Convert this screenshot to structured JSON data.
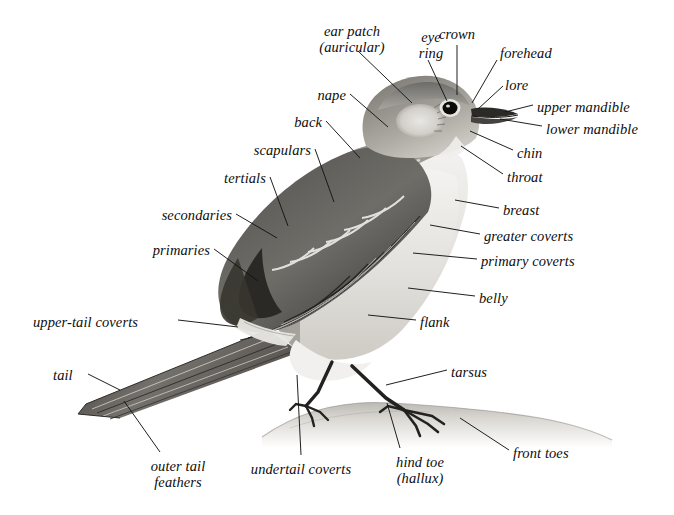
{
  "diagram": {
    "background_color": "#ffffff",
    "ink_color": "#0d0d0d",
    "label_style": "italic serif"
  },
  "labels": [
    {
      "id": "ear-patch",
      "text": "ear patch\n(auricular)",
      "align": "center",
      "x": 303,
      "y": 24,
      "w": 98
    },
    {
      "id": "eye-ring",
      "text": "eye\nring",
      "align": "center",
      "x": 411,
      "y": 30,
      "w": 40
    },
    {
      "id": "crown",
      "text": "crown",
      "align": "center",
      "x": 428,
      "y": 27,
      "w": 58
    },
    {
      "id": "forehead",
      "text": "forehead",
      "align": "left",
      "x": 500,
      "y": 46,
      "w": 72
    },
    {
      "id": "lore",
      "text": "lore",
      "align": "left",
      "x": 505,
      "y": 78,
      "w": 40
    },
    {
      "id": "upper-mandible",
      "text": "upper mandible",
      "align": "left",
      "x": 537,
      "y": 100,
      "w": 128
    },
    {
      "id": "lower-mandible",
      "text": "lower mandible",
      "align": "left",
      "x": 546,
      "y": 122,
      "w": 128
    },
    {
      "id": "chin",
      "text": "chin",
      "align": "left",
      "x": 517,
      "y": 146,
      "w": 42
    },
    {
      "id": "throat",
      "text": "throat",
      "align": "left",
      "x": 507,
      "y": 170,
      "w": 56
    },
    {
      "id": "breast",
      "text": "breast",
      "align": "left",
      "x": 503,
      "y": 203,
      "w": 58
    },
    {
      "id": "greater-coverts",
      "text": "greater coverts",
      "align": "left",
      "x": 484,
      "y": 229,
      "w": 130
    },
    {
      "id": "primary-coverts",
      "text": "primary coverts",
      "align": "left",
      "x": 481,
      "y": 254,
      "w": 130
    },
    {
      "id": "belly",
      "text": "belly",
      "align": "left",
      "x": 479,
      "y": 291,
      "w": 46
    },
    {
      "id": "flank",
      "text": "flank",
      "align": "left",
      "x": 420,
      "y": 315,
      "w": 46
    },
    {
      "id": "tarsus",
      "text": "tarsus",
      "align": "left",
      "x": 451,
      "y": 365,
      "w": 54
    },
    {
      "id": "front-toes",
      "text": "front toes",
      "align": "left",
      "x": 513,
      "y": 446,
      "w": 84
    },
    {
      "id": "hind-toe",
      "text": "hind toe\n(hallux)",
      "align": "center",
      "x": 383,
      "y": 455,
      "w": 74
    },
    {
      "id": "undertail-coverts",
      "text": "undertail coverts",
      "align": "center",
      "x": 231,
      "y": 462,
      "w": 140
    },
    {
      "id": "outer-tail-feathers",
      "text": "outer tail\nfeathers",
      "align": "center",
      "x": 136,
      "y": 459,
      "w": 84
    },
    {
      "id": "tail",
      "text": "tail",
      "align": "left",
      "x": 53,
      "y": 368,
      "w": 32
    },
    {
      "id": "upper-tail-coverts",
      "text": "upper-tail coverts",
      "align": "left",
      "x": 33,
      "y": 315,
      "w": 142
    },
    {
      "id": "primaries",
      "text": "primaries",
      "align": "right",
      "x": 132,
      "y": 243,
      "w": 78
    },
    {
      "id": "secondaries",
      "text": "secondaries",
      "align": "right",
      "x": 136,
      "y": 208,
      "w": 96
    },
    {
      "id": "tertials",
      "text": "tertials",
      "align": "right",
      "x": 200,
      "y": 171,
      "w": 66
    },
    {
      "id": "scapulars",
      "text": "scapulars",
      "align": "right",
      "x": 229,
      "y": 143,
      "w": 82
    },
    {
      "id": "back",
      "text": "back",
      "align": "right",
      "x": 278,
      "y": 115,
      "w": 44
    },
    {
      "id": "nape",
      "text": "nape",
      "align": "right",
      "x": 300,
      "y": 88,
      "w": 46
    }
  ],
  "leader_lines": [
    {
      "id": "ear-patch-leader",
      "d": "M 358 51 L 412 103"
    },
    {
      "id": "eye-ring-leader",
      "d": "M 428 60 L 447 101"
    },
    {
      "id": "crown-leader",
      "d": "M 457 45 L 457 95"
    },
    {
      "id": "forehead-leader",
      "d": "M 497 60 L 472 103"
    },
    {
      "id": "lore-leader",
      "d": "M 503 86 L 478 109"
    },
    {
      "id": "upper-mandible-leader",
      "d": "M 533 105 L 505 112"
    },
    {
      "id": "lower-mandible-leader",
      "d": "M 542 126 L 500 119"
    },
    {
      "id": "chin-leader",
      "d": "M 513 150 L 470 131"
    },
    {
      "id": "throat-leader",
      "d": "M 503 174 L 461 146"
    },
    {
      "id": "breast-leader",
      "d": "M 499 208 L 455 200"
    },
    {
      "id": "greater-coverts-leader",
      "d": "M 480 234 L 430 225"
    },
    {
      "id": "primary-coverts-leader",
      "d": "M 477 259 L 413 253"
    },
    {
      "id": "belly-leader",
      "d": "M 475 296 L 408 288"
    },
    {
      "id": "flank-leader",
      "d": "M 416 320 L 368 315"
    },
    {
      "id": "tarsus-leader",
      "d": "M 447 370 L 386 385"
    },
    {
      "id": "front-toes-leader",
      "d": "M 509 450 L 460 418"
    },
    {
      "id": "hind-toe-leader",
      "d": "M 400 448 L 387 403"
    },
    {
      "id": "undertail-leader",
      "d": "M 301 455 L 297 375"
    },
    {
      "id": "outer-tail-leader",
      "d": "M 160 452 L 124 401"
    },
    {
      "id": "tail-leader",
      "d": "M 88 374 L 120 390"
    },
    {
      "id": "upper-tail-leader",
      "d": "M 178 320 L 238 327"
    },
    {
      "id": "primaries-leader",
      "d": "M 214 249 L 258 281"
    },
    {
      "id": "secondaries-leader",
      "d": "M 236 214 L 277 238"
    },
    {
      "id": "tertials-leader",
      "d": "M 270 177 L 288 226"
    },
    {
      "id": "scapulars-leader",
      "d": "M 315 149 L 334 202"
    },
    {
      "id": "back-leader",
      "d": "M 326 121 L 360 158"
    },
    {
      "id": "nape-leader",
      "d": "M 350 94 L 388 127"
    }
  ]
}
